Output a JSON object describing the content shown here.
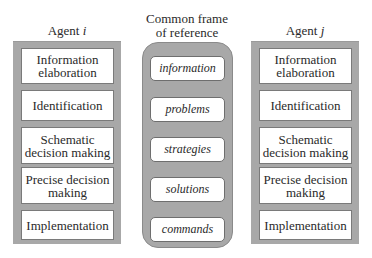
{
  "agent_i": {
    "title_prefix": "Agent ",
    "title_var": "i",
    "stages": [
      "Information elaboration",
      "Identification",
      "Schematic decision making",
      "Precise decision making",
      "Implementation"
    ]
  },
  "common_frame": {
    "title_line1": "Common frame",
    "title_line2": "of reference",
    "items": [
      "information",
      "problems",
      "strategies",
      "solutions",
      "commands"
    ]
  },
  "agent_j": {
    "title_prefix": "Agent ",
    "title_var": "j",
    "stages": [
      "Information elaboration",
      "Identification",
      "Schematic decision making",
      "Precise decision making",
      "Implementation"
    ]
  },
  "colors": {
    "panel_fill": "#a8a8a8",
    "box_fill": "#ffffff",
    "text": "#2a2a2a"
  }
}
